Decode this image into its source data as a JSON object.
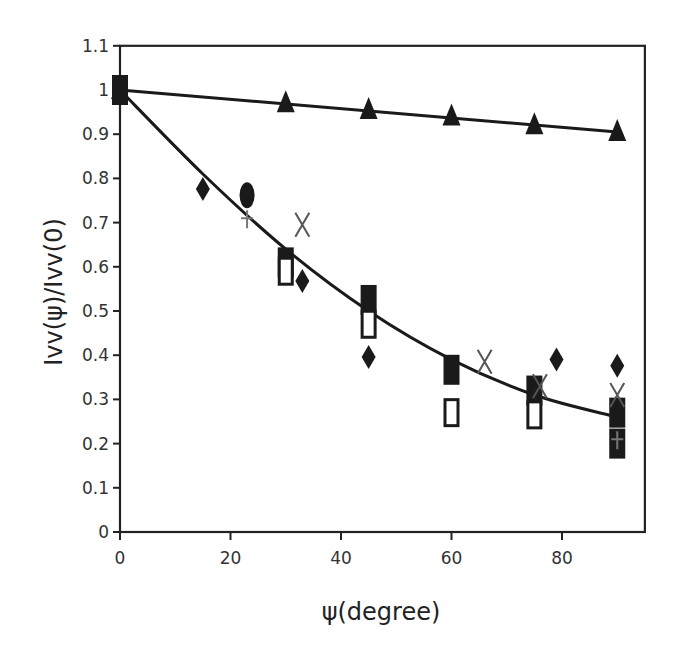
{
  "chart_data": {
    "type": "scatter",
    "title": "",
    "xlabel": "ψ(degree)",
    "ylabel": "Ivv(ψ)/Ivv(0)",
    "xlim": [
      0,
      95
    ],
    "ylim": [
      0,
      1.1
    ],
    "xticks": [
      0,
      20,
      40,
      60,
      80
    ],
    "yticks": [
      0,
      0.1,
      0.2,
      0.3,
      0.4,
      0.5,
      0.6,
      0.7,
      0.8,
      0.9,
      1,
      1.1
    ],
    "xtick_labels": [
      "0",
      "20",
      "40",
      "60",
      "80"
    ],
    "ytick_labels": [
      "0",
      "0.1",
      "0.2",
      "0.3",
      "0.4",
      "0.5",
      "0.6",
      "0.7",
      "0.8",
      "0.9",
      "1",
      "1.1"
    ],
    "grid": false,
    "legend": null,
    "series": [
      {
        "name": "triangles",
        "marker": "triangle-filled",
        "x": [
          0,
          30,
          45,
          60,
          75,
          90
        ],
        "y": [
          1.0,
          0.97,
          0.955,
          0.94,
          0.92,
          0.905
        ]
      },
      {
        "name": "filled squares",
        "marker": "square-filled",
        "x": [
          0,
          30,
          45,
          60,
          75,
          90,
          90
        ],
        "y": [
          1.0,
          0.61,
          0.525,
          0.367,
          0.32,
          0.27,
          0.2
        ]
      },
      {
        "name": "open squares",
        "marker": "square-open",
        "x": [
          30,
          45,
          60,
          75
        ],
        "y": [
          0.59,
          0.47,
          0.27,
          0.265
        ]
      },
      {
        "name": "diamonds",
        "marker": "diamond-filled",
        "x": [
          15,
          33,
          45,
          79,
          90
        ],
        "y": [
          0.776,
          0.568,
          0.396,
          0.39,
          0.376
        ]
      },
      {
        "name": "ellipse",
        "marker": "ellipse-filled",
        "x": [
          23
        ],
        "y": [
          0.762
        ]
      },
      {
        "name": "crosses",
        "marker": "x",
        "x": [
          33,
          66,
          76,
          90
        ],
        "y": [
          0.695,
          0.385,
          0.33,
          0.31
        ]
      },
      {
        "name": "plus",
        "marker": "plus",
        "x": [
          23,
          90
        ],
        "y": [
          0.71,
          0.21
        ]
      }
    ],
    "fit_lines": [
      {
        "name": "linear fit (triangles)",
        "type": "line",
        "x": [
          0,
          90
        ],
        "y": [
          1.0,
          0.905
        ]
      },
      {
        "name": "curve fit",
        "type": "curve",
        "x": [
          0,
          15,
          30,
          45,
          60,
          75,
          90
        ],
        "y": [
          1.0,
          0.81,
          0.64,
          0.5,
          0.39,
          0.31,
          0.26
        ]
      }
    ]
  },
  "colors": {
    "axis": "#222222",
    "markers": "#1a1a1a",
    "background": "#ffffff"
  }
}
